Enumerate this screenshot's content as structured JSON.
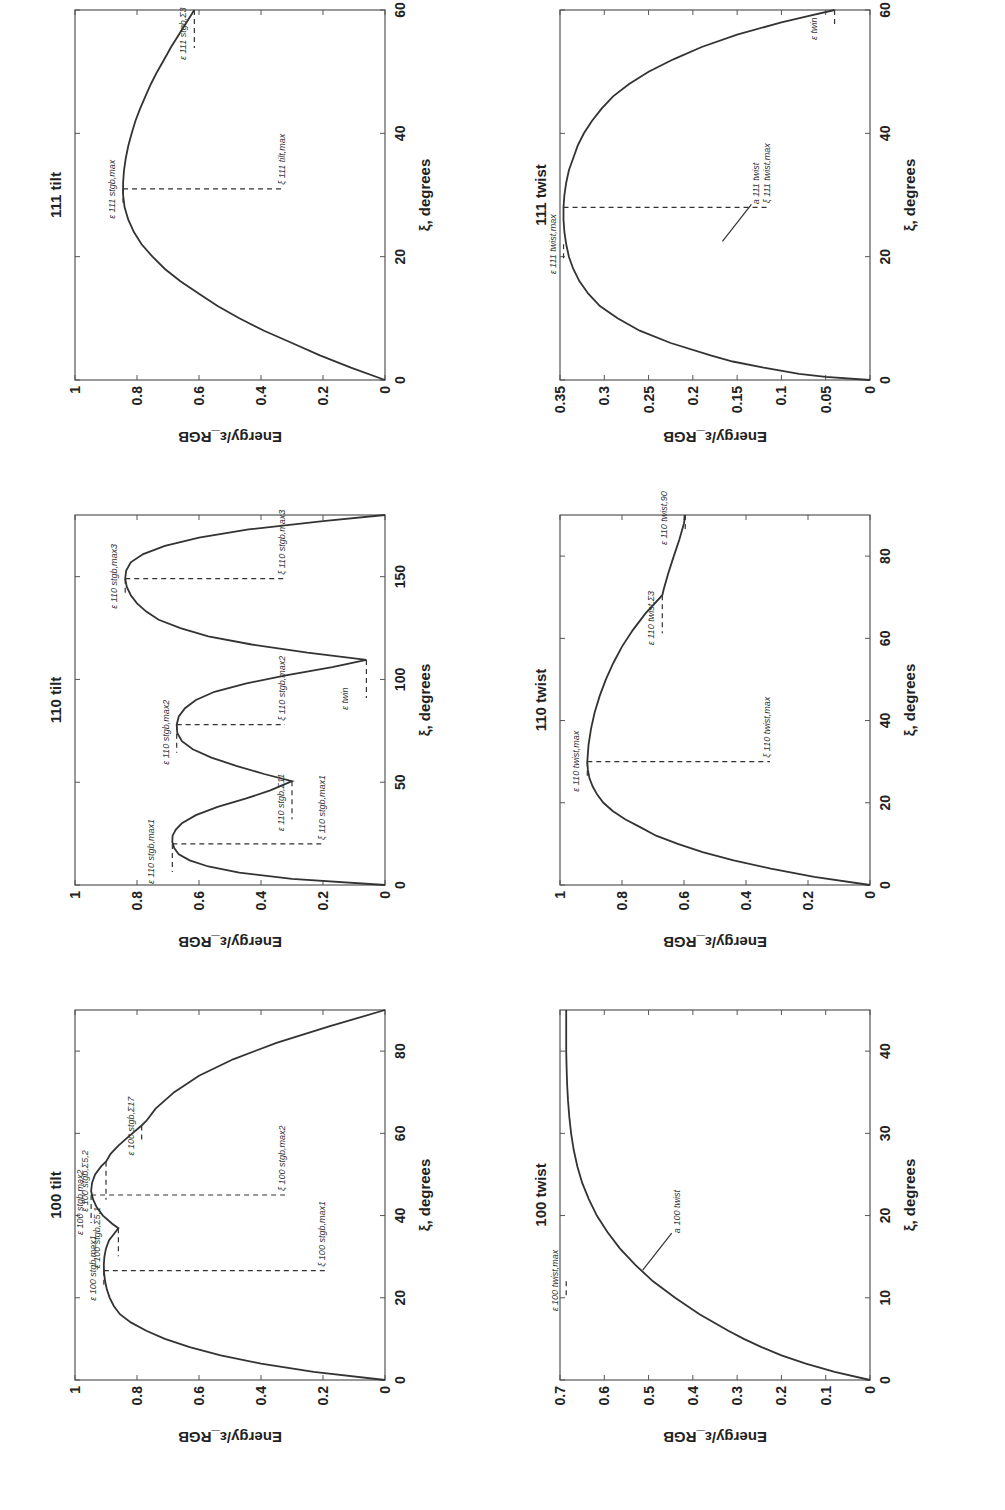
{
  "figure": {
    "rotation_deg": -90,
    "ylabel": "Energy/ε_RGB",
    "xlabel": "ξ, degrees"
  },
  "chart_data": [
    {
      "id": "p100tilt",
      "type": "line",
      "title": "100 tilt",
      "xlabel": "ξ, degrees",
      "ylabel": "Energy/ε_RGB",
      "xlim": [
        0,
        90
      ],
      "ylim": [
        0,
        1
      ],
      "xticks": [
        0,
        20,
        40,
        60,
        80
      ],
      "yticks": [
        0,
        0.2,
        0.4,
        0.6,
        0.8,
        1
      ],
      "ytick_labels": [
        "0",
        "0.2",
        "0.4",
        "0.6",
        "0.8",
        "1"
      ],
      "series": [
        {
          "name": "energy",
          "x": [
            0,
            2,
            4,
            6,
            8,
            10,
            12,
            14,
            16,
            18,
            20,
            22,
            24,
            26,
            28,
            30,
            32,
            34,
            36.9,
            38,
            40,
            42,
            44,
            46,
            48,
            50,
            52,
            53.1,
            55,
            57,
            59,
            61.9,
            63,
            66,
            70,
            74,
            78,
            82,
            86,
            90
          ],
          "y": [
            0,
            0.23,
            0.4,
            0.53,
            0.63,
            0.71,
            0.77,
            0.82,
            0.855,
            0.875,
            0.888,
            0.897,
            0.903,
            0.906,
            0.907,
            0.905,
            0.9,
            0.89,
            0.86,
            0.88,
            0.91,
            0.93,
            0.942,
            0.948,
            0.945,
            0.935,
            0.915,
            0.9,
            0.885,
            0.86,
            0.83,
            0.785,
            0.77,
            0.74,
            0.68,
            0.6,
            0.49,
            0.35,
            0.18,
            0
          ]
        }
      ],
      "annotations": [
        {
          "label": "ε 100 stgb,max1",
          "x": 26.6,
          "y": 0.907
        },
        {
          "label": "ε 100 stgb,Σ5,1",
          "x": 36.9,
          "y": 0.86
        },
        {
          "label": "ξ 100 stgb,max1",
          "x": 26.6,
          "y": 0.907
        },
        {
          "label": "ξ 100 stgb,max2",
          "x": 45,
          "y": 0.948
        },
        {
          "label": "ε 100 stgb,max2",
          "x": 45,
          "y": 0.948
        },
        {
          "label": "ε 100 stgb,Σ5,2",
          "x": 53.1,
          "y": 0.9
        },
        {
          "label": "ε 100 stgb,Σ17",
          "x": 61.9,
          "y": 0.785
        }
      ]
    },
    {
      "id": "p110tilt",
      "type": "line",
      "title": "110 tilt",
      "xlabel": "ξ, degrees",
      "ylabel": "Energy/ε_RGB",
      "xlim": [
        0,
        180
      ],
      "ylim": [
        0,
        1
      ],
      "xticks": [
        0,
        50,
        100,
        150
      ],
      "yticks": [
        0,
        0.2,
        0.4,
        0.6,
        0.8,
        1
      ],
      "ytick_labels": [
        "0",
        "0.2",
        "0.4",
        "0.6",
        "0.8",
        "1"
      ],
      "series": [
        {
          "name": "energy",
          "x": [
            0,
            3,
            6,
            9,
            12,
            15,
            18,
            21,
            24,
            27,
            30,
            34,
            38,
            42,
            46,
            50.5,
            54,
            58,
            62,
            66,
            70,
            74,
            78,
            82,
            86,
            90,
            94,
            98,
            102,
            106,
            109.5,
            113,
            117,
            121,
            125,
            129,
            133,
            137,
            141,
            145,
            149,
            153,
            157,
            161,
            165,
            169,
            173,
            177,
            180
          ],
          "y": [
            0,
            0.3,
            0.47,
            0.57,
            0.63,
            0.665,
            0.68,
            0.686,
            0.685,
            0.675,
            0.655,
            0.61,
            0.54,
            0.45,
            0.37,
            0.3,
            0.39,
            0.48,
            0.56,
            0.62,
            0.655,
            0.67,
            0.672,
            0.665,
            0.645,
            0.61,
            0.55,
            0.45,
            0.32,
            0.17,
            0.06,
            0.25,
            0.43,
            0.57,
            0.66,
            0.73,
            0.77,
            0.8,
            0.82,
            0.833,
            0.838,
            0.835,
            0.82,
            0.78,
            0.71,
            0.6,
            0.44,
            0.2,
            0
          ]
        }
      ],
      "annotations": [
        {
          "label": "ξ 110 stgb,max1",
          "x": 20,
          "y": 0.686
        },
        {
          "label": "ε 110 stgb,max1",
          "x": 20,
          "y": 0.686
        },
        {
          "label": "ε 110 stgb,Σ11",
          "x": 50.5,
          "y": 0.3
        },
        {
          "label": "ξ 110 stgb,max2",
          "x": 78,
          "y": 0.672
        },
        {
          "label": "ε 110 stgb,max2",
          "x": 78,
          "y": 0.672
        },
        {
          "label": "ε twin",
          "x": 109.5,
          "y": 0.06
        },
        {
          "label": "ε 110 stgb,max3",
          "x": 149,
          "y": 0.838
        },
        {
          "label": "ξ 110 stgb,max3",
          "x": 149,
          "y": 0.838
        }
      ]
    },
    {
      "id": "p111tilt",
      "type": "line",
      "title": "111 tilt",
      "xlabel": "ξ, degrees",
      "ylabel": "Energy/ε_RGB",
      "xlim": [
        0,
        60
      ],
      "ylim": [
        0,
        1
      ],
      "xticks": [
        0,
        20,
        40,
        60
      ],
      "yticks": [
        0,
        0.2,
        0.4,
        0.6,
        0.8,
        1
      ],
      "ytick_labels": [
        "0",
        "0.2",
        "0.4",
        "0.6",
        "0.8",
        "1"
      ],
      "series": [
        {
          "name": "energy",
          "x": [
            0,
            2,
            4,
            6,
            8,
            10,
            12,
            14,
            16,
            18,
            20,
            22,
            24,
            26,
            28,
            30,
            32,
            34,
            36,
            38,
            40,
            42,
            44,
            46,
            48,
            50,
            52,
            54,
            56,
            58,
            60
          ],
          "y": [
            0,
            0.11,
            0.21,
            0.3,
            0.39,
            0.47,
            0.54,
            0.6,
            0.66,
            0.71,
            0.75,
            0.785,
            0.81,
            0.828,
            0.84,
            0.845,
            0.845,
            0.842,
            0.836,
            0.828,
            0.817,
            0.805,
            0.79,
            0.773,
            0.755,
            0.735,
            0.712,
            0.69,
            0.665,
            0.64,
            0.615
          ]
        }
      ],
      "annotations": [
        {
          "label": "ε 111 stgb,max",
          "x": 31,
          "y": 0.845
        },
        {
          "label": "ξ 111 tilt,max",
          "x": 31,
          "y": 0.845
        },
        {
          "label": "ε 111 stgb,Σ3",
          "x": 60,
          "y": 0.615
        }
      ]
    },
    {
      "id": "p100twist",
      "type": "line",
      "title": "100 twist",
      "xlabel": "ξ, degrees",
      "ylabel": "Energy/ε_RGB",
      "xlim": [
        0,
        45
      ],
      "ylim": [
        0,
        0.7
      ],
      "xticks": [
        0,
        10,
        20,
        30,
        40
      ],
      "yticks": [
        0,
        0.1,
        0.2,
        0.3,
        0.4,
        0.5,
        0.6,
        0.7
      ],
      "ytick_labels": [
        "0",
        "0.1",
        "0.2",
        "0.3",
        "0.4",
        "0.5",
        "0.6",
        "0.7"
      ],
      "series": [
        {
          "name": "energy",
          "x": [
            0,
            1,
            2,
            3,
            4,
            5,
            6,
            8,
            10,
            12,
            14,
            16,
            18,
            20,
            22,
            24,
            26,
            28,
            30,
            32,
            34,
            36,
            38,
            40,
            42,
            45
          ],
          "y": [
            0,
            0.08,
            0.145,
            0.2,
            0.245,
            0.285,
            0.32,
            0.385,
            0.44,
            0.49,
            0.53,
            0.565,
            0.593,
            0.617,
            0.635,
            0.65,
            0.661,
            0.669,
            0.675,
            0.679,
            0.682,
            0.684,
            0.685,
            0.686,
            0.686,
            0.686
          ]
        }
      ],
      "annotations": [
        {
          "label": "ε 100 twist,max",
          "x": 12,
          "y": 0.686
        },
        {
          "label": "a 100 twist",
          "x": 13,
          "y": 0.52
        }
      ]
    },
    {
      "id": "p110twist",
      "type": "line",
      "title": "110 twist",
      "xlabel": "ξ, degrees",
      "ylabel": "Energy/ε_RGB",
      "xlim": [
        0,
        90
      ],
      "ylim": [
        0,
        1
      ],
      "xticks": [
        0,
        20,
        40,
        60,
        80
      ],
      "yticks": [
        0,
        0.2,
        0.4,
        0.6,
        0.8,
        1
      ],
      "ytick_labels": [
        "0",
        "0.2",
        "0.4",
        "0.6",
        "0.8",
        "1"
      ],
      "series": [
        {
          "name": "energy",
          "x": [
            0,
            2,
            4,
            6,
            8,
            10,
            12,
            14,
            16,
            18,
            20,
            22,
            24,
            26,
            28,
            30,
            34,
            38,
            42,
            46,
            50,
            54,
            58,
            62,
            66,
            70.5,
            72,
            76,
            80,
            84,
            88,
            90
          ],
          "y": [
            0,
            0.18,
            0.32,
            0.44,
            0.54,
            0.62,
            0.69,
            0.74,
            0.79,
            0.83,
            0.86,
            0.88,
            0.895,
            0.905,
            0.91,
            0.912,
            0.908,
            0.9,
            0.888,
            0.872,
            0.852,
            0.828,
            0.8,
            0.765,
            0.725,
            0.67,
            0.665,
            0.65,
            0.633,
            0.615,
            0.6,
            0.596
          ]
        }
      ],
      "annotations": [
        {
          "label": "ε 110 twist,max",
          "x": 30,
          "y": 0.912
        },
        {
          "label": "ξ 110 twist,max",
          "x": 30,
          "y": 0.912
        },
        {
          "label": "ε 110 twist,Σ3",
          "x": 70.5,
          "y": 0.67
        },
        {
          "label": "ε 110 twist,90",
          "x": 90,
          "y": 0.596
        }
      ]
    },
    {
      "id": "p111twist",
      "type": "line",
      "title": "111 twist",
      "xlabel": "ξ, degrees",
      "ylabel": "Energy/ε_RGB",
      "xlim": [
        0,
        60
      ],
      "ylim": [
        0,
        0.35
      ],
      "xticks": [
        0,
        20,
        40,
        60
      ],
      "yticks": [
        0,
        0.05,
        0.1,
        0.15,
        0.2,
        0.25,
        0.3,
        0.35
      ],
      "ytick_labels": [
        "0",
        "0.05",
        "0.1",
        "0.15",
        "0.2",
        "0.25",
        "0.3",
        "0.35"
      ],
      "series": [
        {
          "name": "energy",
          "x": [
            0,
            0.5,
            1,
            2,
            3,
            4,
            6,
            8,
            10,
            12,
            14,
            16,
            18,
            20,
            22,
            24,
            26,
            28,
            30,
            32,
            34,
            36,
            38,
            40,
            42,
            44,
            46,
            48,
            50,
            52,
            54,
            56,
            58,
            59,
            60
          ],
          "y": [
            0,
            0.05,
            0.08,
            0.12,
            0.155,
            0.18,
            0.225,
            0.26,
            0.285,
            0.305,
            0.318,
            0.328,
            0.335,
            0.34,
            0.343,
            0.345,
            0.346,
            0.346,
            0.345,
            0.343,
            0.34,
            0.335,
            0.33,
            0.323,
            0.314,
            0.303,
            0.29,
            0.272,
            0.25,
            0.222,
            0.19,
            0.15,
            0.1,
            0.07,
            0.04
          ]
        }
      ],
      "annotations": [
        {
          "label": "ε 111 twist,max",
          "x": 22,
          "y": 0.346
        },
        {
          "label": "ξ 111 twist,max",
          "x": 28,
          "y": 0.346
        },
        {
          "label": "a 111 twist",
          "x": 22,
          "y": 0.17
        },
        {
          "label": "ε twin",
          "x": 60,
          "y": 0.04
        }
      ]
    }
  ]
}
